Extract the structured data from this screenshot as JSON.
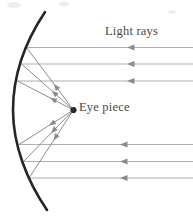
{
  "figure": {
    "background_color": "#ffffff",
    "width": 193,
    "height": 218,
    "labels": {
      "light_rays": "Light rays",
      "eye_piece": "Eye piece"
    },
    "colors": {
      "mirror": "#262626",
      "incoming_ray": "#b0b0b0",
      "reflected_ray": "#8d8d99",
      "arrow": "#8a8a8a",
      "focal_point": "#2b2b2b",
      "text": "#4a4a4a"
    },
    "mirror": {
      "name": "parabolic-mirror",
      "stroke_width": 2.6,
      "vertex": [
        13,
        110
      ],
      "top_end": [
        45,
        12
      ],
      "bottom_end": [
        47,
        210
      ],
      "path": "M 45 12 C 25 42, 13 75, 13 110 C 13 145, 27 181, 47 210"
    },
    "focal_point": {
      "name": "eye-piece-focal-point",
      "cx": 73.5,
      "cy": 110,
      "r": 3.1
    },
    "incoming_rays": [
      {
        "y": 47.5,
        "x_start": 193,
        "x_end": 26.5,
        "arrow_x": 127
      },
      {
        "y": 64.0,
        "x_start": 193,
        "x_end": 21.5,
        "arrow_x": 127
      },
      {
        "y": 81.0,
        "x_start": 193,
        "x_end": 17.5,
        "arrow_x": 127
      },
      {
        "y": 144.5,
        "x_start": 193,
        "x_end": 19.0,
        "arrow_x": 120
      },
      {
        "y": 161.5,
        "x_start": 193,
        "x_end": 23.5,
        "arrow_x": 120
      },
      {
        "y": 178.0,
        "x_start": 193,
        "x_end": 29.0,
        "arrow_x": 120
      }
    ],
    "reflected_rays": [
      {
        "from": [
          73.5,
          110
        ],
        "to": [
          26.5,
          47.5
        ],
        "arrow_t": 0.42
      },
      {
        "from": [
          73.5,
          110
        ],
        "to": [
          21.5,
          64.0
        ],
        "arrow_t": 0.42
      },
      {
        "from": [
          73.5,
          110
        ],
        "to": [
          17.5,
          81.0
        ],
        "arrow_t": 0.42
      },
      {
        "from": [
          73.5,
          110
        ],
        "to": [
          19.0,
          144.5
        ],
        "arrow_t": 0.45
      },
      {
        "from": [
          73.5,
          110
        ],
        "to": [
          23.5,
          161.5
        ],
        "arrow_t": 0.45
      },
      {
        "from": [
          73.5,
          110
        ],
        "to": [
          29.0,
          178.0
        ],
        "arrow_t": 0.45
      }
    ],
    "artifacts": [
      {
        "cx": 14,
        "cy": 5,
        "rx": 7,
        "ry": 3
      },
      {
        "cx": 64,
        "cy": 4,
        "rx": 5,
        "ry": 2.5
      },
      {
        "cx": 172,
        "cy": 12,
        "rx": 4,
        "ry": 2
      }
    ]
  }
}
